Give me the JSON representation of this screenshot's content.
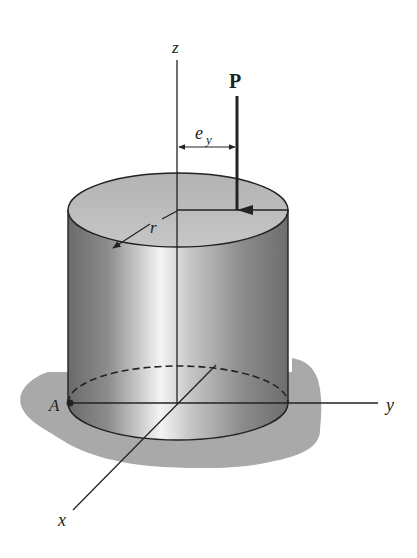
{
  "figure": {
    "labels": {
      "z_axis": "z",
      "y_axis": "y",
      "x_axis": "x",
      "load": "P",
      "eccentricity": "e",
      "eccentricity_subscript": "y",
      "radius": "r",
      "point": "A"
    },
    "colors": {
      "line": "#222222",
      "ground_shadow": "#a9a9a9",
      "top_face": "#bdbdbd",
      "cylinder_dark": "#6e6e6e",
      "cylinder_light": "#f2f2f2"
    }
  }
}
